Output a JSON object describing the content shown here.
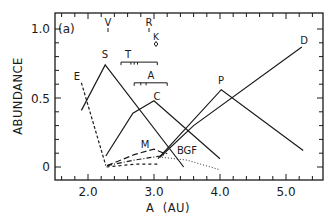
{
  "chart_data": {
    "type": "line",
    "panel_label": "(a)",
    "xlabel": "A  (AU)",
    "ylabel": "ABUNDANCE",
    "xlim": [
      1.5,
      5.45
    ],
    "ylim": [
      -0.1,
      1.1
    ],
    "x_ticks": [
      2.0,
      3.0,
      4.0,
      5.0
    ],
    "x_tick_labels": [
      "2.0",
      "3.0",
      "4.0",
      "5.0"
    ],
    "y_ticks": [
      0,
      0.5,
      1.0
    ],
    "y_tick_labels": [
      "0",
      "0.5",
      "1.0"
    ],
    "x_minor_step": 0.2,
    "y_minor_step": 0.1,
    "grid": false,
    "legend": "none (inline labels)",
    "series": [
      {
        "name": "E",
        "style": "dashed",
        "x": [
          1.9,
          2.27
        ],
        "y": [
          0.61,
          0.01
        ],
        "label_pos": [
          1.88,
          0.63
        ]
      },
      {
        "name": "S",
        "style": "solid",
        "x": [
          1.9,
          2.26,
          3.45
        ],
        "y": [
          0.41,
          0.74,
          0.0
        ],
        "label_pos": [
          2.24,
          0.79
        ]
      },
      {
        "name": "C",
        "style": "solid",
        "x": [
          2.27,
          2.68,
          3.0,
          4.0
        ],
        "y": [
          0.08,
          0.39,
          0.48,
          0.06
        ],
        "label_pos": [
          3.0,
          0.53
        ]
      },
      {
        "name": "P",
        "style": "solid",
        "x": [
          3.06,
          4.02,
          5.26
        ],
        "y": [
          0.06,
          0.56,
          0.12
        ],
        "label_pos": [
          4.02,
          0.61
        ]
      },
      {
        "name": "D",
        "style": "solid",
        "x": [
          3.09,
          3.6,
          5.24
        ],
        "y": [
          0.07,
          0.3,
          0.87
        ],
        "label_pos": [
          5.24,
          0.91
        ]
      },
      {
        "name": "M",
        "style": "long-dashed",
        "x": [
          2.29,
          2.7,
          3.0,
          3.15
        ],
        "y": [
          0.01,
          0.09,
          0.13,
          0.1
        ],
        "label_pos": [
          2.85,
          0.16
        ]
      },
      {
        "name": "BGF",
        "style": "dotted",
        "x": [
          3.12,
          3.5,
          4.0
        ],
        "y": [
          0.07,
          0.05,
          -0.02
        ],
        "label_pos": [
          3.38,
          0.1
        ]
      },
      {
        "name": "(unlabeled dash-dot)",
        "style": "dash-dot",
        "x": [
          2.29,
          2.7,
          3.1,
          3.2
        ],
        "y": [
          0.01,
          0.05,
          0.08,
          0.1
        ]
      },
      {
        "name": "(unlabeled short-dashed)",
        "style": "short-dashed",
        "x": [
          2.28,
          2.7,
          3.05
        ],
        "y": [
          0.0,
          0.02,
          0.02
        ]
      }
    ],
    "annotations": [
      {
        "text": "V",
        "x": 2.3,
        "y": 1.02,
        "marker": "short vertical tick"
      },
      {
        "text": "R",
        "x": 2.92,
        "y": 1.02,
        "marker": "short vertical tick"
      },
      {
        "text": "K",
        "x": 3.03,
        "y": 0.95,
        "marker": "diamond"
      },
      {
        "text": "T",
        "x": 2.52,
        "y": 0.78,
        "range": [
          2.5,
          3.05
        ],
        "bracket_y": 0.76,
        "minor_ticks": [
          2.65,
          2.7,
          2.75
        ]
      },
      {
        "text": "A",
        "x": 2.93,
        "y": 0.63,
        "range": [
          2.7,
          3.2
        ],
        "bracket_y": 0.61,
        "minor_ticks": [
          2.8,
          2.88
        ]
      }
    ]
  },
  "labels": {
    "panel": "(a)",
    "xlabel": "A  (AU)",
    "ylabel": "ABUNDANCE",
    "x_ticks": [
      "2.0",
      "3.0",
      "4.0",
      "5.0"
    ],
    "y_ticks": [
      "0",
      "0.5",
      "1.0"
    ],
    "series": {
      "E": "E",
      "S": "S",
      "C": "C",
      "P": "P",
      "D": "D",
      "M": "M",
      "BGF": "BGF"
    },
    "annotations": {
      "V": "V",
      "R": "R",
      "K": "K",
      "T": "T",
      "A": "A"
    }
  }
}
